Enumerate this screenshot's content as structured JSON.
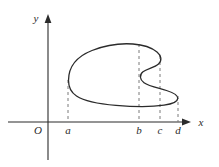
{
  "figure": {
    "kind": "closed-curve-on-axes",
    "background_color": "#ffffff",
    "ink_color": "#2b2b2b",
    "curve_color": "#2b2b2b",
    "dashed_color": "#7a7a7a",
    "axes": {
      "x_axis_label": "x",
      "y_axis_label": "y",
      "origin_label": "O",
      "x_axis_y_px": 122,
      "y_axis_x_px": 48,
      "x_axis_from_px": 8,
      "x_axis_to_px": 191,
      "y_axis_from_px": 160,
      "y_axis_to_px": 15
    },
    "tick_labels": [
      {
        "name": "a",
        "text": "a",
        "x_px": 68
      },
      {
        "name": "b",
        "text": "b",
        "x_px": 139
      },
      {
        "name": "c",
        "text": "c",
        "x_px": 160
      },
      {
        "name": "d",
        "text": "d",
        "x_px": 178
      }
    ],
    "dashed_lines": [
      {
        "name": "dashed-a",
        "x_px": 68,
        "y_top_px": 80,
        "y_bottom_px": 122
      },
      {
        "name": "dashed-b",
        "x_px": 139,
        "y_top_px": 44,
        "y_bottom_px": 122
      },
      {
        "name": "dashed-c",
        "x_px": 160,
        "y_top_px": 58,
        "y_bottom_px": 122
      },
      {
        "name": "dashed-d",
        "x_px": 178,
        "y_top_px": 96,
        "y_bottom_px": 122
      }
    ],
    "curve_path": "M 68.5 80.5 C 68.5 66.0 78.0 56.0 92.0 50.5 C 106.0 45.0 122.0 43.2 133.0 44.0 C 143.0 44.7 151.5 47.5 157.0 52.0 C 161.5 55.7 162.2 60.5 158.5 64.0 C 154.5 67.8 147.0 68.6 143.0 71.8 C 139.2 74.8 139.6 79.6 144.0 82.8 C 149.0 86.4 158.5 88.0 166.5 90.5 C 173.5 92.7 178.0 95.4 177.8 98.4 C 177.6 101.6 172.0 104.0 164.0 105.2 C 152.0 107.0 133.0 106.8 116.0 105.4 C 99.0 104.0 84.5 101.2 76.5 96.0 C 69.8 91.6 68.5 86.2 68.5 80.5 Z"
  }
}
